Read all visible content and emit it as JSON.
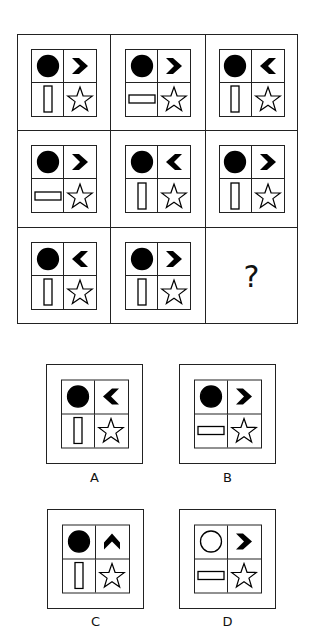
{
  "puzzle": {
    "type": "3x3 matrix reasoning",
    "missing_symbol": "?",
    "grid": [
      [
        {
          "circle": "filled",
          "chevron": "right",
          "rect": "vertical",
          "star": "outline"
        },
        {
          "circle": "filled",
          "chevron": "right",
          "rect": "horizontal",
          "star": "outline"
        },
        {
          "circle": "filled",
          "chevron": "left",
          "rect": "vertical",
          "star": "outline"
        }
      ],
      [
        {
          "circle": "filled",
          "chevron": "right",
          "rect": "horizontal",
          "star": "outline"
        },
        {
          "circle": "filled",
          "chevron": "left",
          "rect": "vertical",
          "star": "outline"
        },
        {
          "circle": "filled",
          "chevron": "right",
          "rect": "vertical",
          "star": "outline"
        }
      ],
      [
        {
          "circle": "filled",
          "chevron": "left",
          "rect": "vertical",
          "star": "outline"
        },
        {
          "circle": "filled",
          "chevron": "right",
          "rect": "vertical",
          "star": "outline"
        },
        null
      ]
    ],
    "options": [
      {
        "label": "A",
        "circle": "filled",
        "chevron": "left",
        "rect": "vertical",
        "star": "outline"
      },
      {
        "label": "B",
        "circle": "filled",
        "chevron": "right",
        "rect": "horizontal",
        "star": "outline"
      },
      {
        "label": "C",
        "circle": "filled",
        "chevron": "up",
        "rect": "vertical",
        "star": "outline"
      },
      {
        "label": "D",
        "circle": "outline",
        "chevron": "right",
        "rect": "horizontal",
        "star": "outline"
      }
    ]
  }
}
